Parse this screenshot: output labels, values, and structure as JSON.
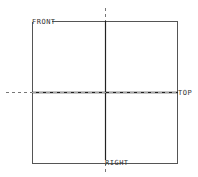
{
  "diagram": {
    "type": "datum-planes-view",
    "planes": [
      {
        "name": "front",
        "label": "FRONT"
      },
      {
        "name": "top",
        "label": "TOP"
      },
      {
        "name": "right",
        "label": "RIGHT"
      }
    ],
    "colors": {
      "line": "#333333",
      "background": "#ffffff"
    }
  }
}
